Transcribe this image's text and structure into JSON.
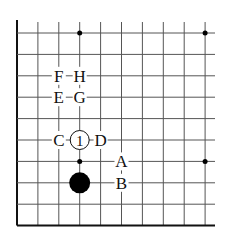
{
  "diagram": {
    "type": "go-board-fragment",
    "grid": {
      "origin_x": 17,
      "origin_y": 33,
      "spacing_x": 20.9,
      "spacing_y": 21.4,
      "columns": 10,
      "rows": 10,
      "line_color": "#555555",
      "edge_color": "#111111"
    },
    "star_points": [
      {
        "col": 3,
        "row": 0
      },
      {
        "col": 9,
        "row": 0
      },
      {
        "col": 3,
        "row": 6
      },
      {
        "col": 9,
        "row": 6
      }
    ],
    "stones": [
      {
        "color": "black",
        "col": 3,
        "row": 7,
        "label": ""
      },
      {
        "color": "white",
        "col": 3,
        "row": 5,
        "label": "1"
      }
    ],
    "labels": [
      {
        "text": "F",
        "col": 2,
        "row": 2
      },
      {
        "text": "H",
        "col": 3,
        "row": 2
      },
      {
        "text": "E",
        "col": 2,
        "row": 3
      },
      {
        "text": "G",
        "col": 3,
        "row": 3
      },
      {
        "text": "C",
        "col": 2,
        "row": 5
      },
      {
        "text": "D",
        "col": 4,
        "row": 5
      },
      {
        "text": "A",
        "col": 5,
        "row": 6
      },
      {
        "text": "B",
        "col": 5,
        "row": 7
      }
    ]
  }
}
